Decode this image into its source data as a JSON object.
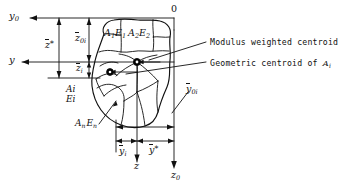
{
  "figure": {
    "type": "engineering-diagram",
    "axes": {
      "origin_label": "0",
      "y0_axis": "y",
      "y0_sub": "0",
      "y_axis": "y",
      "z_axis": "z",
      "z0_axis": "z",
      "z0_sub": "0"
    },
    "dimensions": {
      "z_star": {
        "base": "z",
        "sup": "*"
      },
      "z_0i": {
        "base": "z",
        "sub": "0i"
      },
      "z_i": {
        "base": "z",
        "sub": "i"
      },
      "y_bar_0i": {
        "base": "y",
        "sub": "0i"
      },
      "y_bar_i": {
        "base": "y",
        "sub": "i"
      },
      "y_star": {
        "base": "y",
        "sup": "*"
      }
    },
    "cells": [
      {
        "area": "A",
        "area_sub": "1",
        "modulus": "E",
        "modulus_sub": "1"
      },
      {
        "area": "A",
        "area_sub": "2",
        "modulus": "E",
        "modulus_sub": "2"
      }
    ],
    "stacked_labels": [
      {
        "top_base": "A",
        "top_sub": "i",
        "bottom_base": "E",
        "bottom_sub": "i"
      }
    ],
    "inline_labels": [
      {
        "area": "A",
        "area_sub": "n",
        "modulus": "E",
        "modulus_sub": "n"
      }
    ],
    "annotations": [
      {
        "id": "modulus-weighted-centroid",
        "text": "Modulus weighted centroid"
      },
      {
        "id": "geometric-centroid",
        "text": "Geometric centroid of ",
        "symbol": "A",
        "symbol_sub": "i"
      }
    ],
    "colors": {
      "line": "#111111",
      "background": "#ffffff",
      "marker_fill": "#000000"
    }
  }
}
